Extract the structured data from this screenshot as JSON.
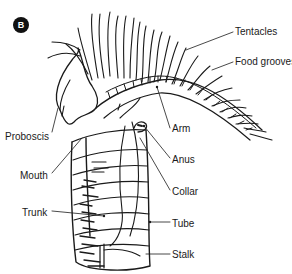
{
  "figure": {
    "panel_label": "B",
    "line_color": "#1a1a1a",
    "labels": [
      {
        "id": "tentacles",
        "text": "Tentacles",
        "x": 235,
        "y": 26
      },
      {
        "id": "food-grooves",
        "text": "Food grooves",
        "x": 235,
        "y": 56
      },
      {
        "id": "arm",
        "text": "Arm",
        "x": 172,
        "y": 123
      },
      {
        "id": "proboscis",
        "text": "Proboscis",
        "x": 5,
        "y": 131
      },
      {
        "id": "mouth",
        "text": "Mouth",
        "x": 20,
        "y": 170
      },
      {
        "id": "anus",
        "text": "Anus",
        "x": 172,
        "y": 154
      },
      {
        "id": "collar",
        "text": "Collar",
        "x": 172,
        "y": 186
      },
      {
        "id": "trunk",
        "text": "Trunk",
        "x": 22,
        "y": 207
      },
      {
        "id": "tube",
        "text": "Tube",
        "x": 172,
        "y": 218
      },
      {
        "id": "stalk",
        "text": "Stalk",
        "x": 172,
        "y": 249
      }
    ]
  }
}
